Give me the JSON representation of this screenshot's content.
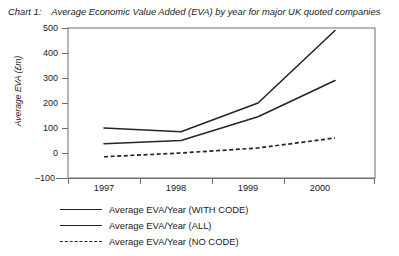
{
  "title": {
    "label": "Chart 1:",
    "text": "Average Economic Value Added (EVA) by year for major UK quoted companies"
  },
  "chart_data": {
    "type": "line",
    "title": "Average Economic Value Added (EVA) by year for major UK quoted companies",
    "xlabel": "",
    "ylabel": "Average EVA (£m)",
    "categories": [
      "1997",
      "1998",
      "1999",
      "2000"
    ],
    "x": [
      1997,
      1998,
      1999,
      2000
    ],
    "ylim": [
      -100,
      500
    ],
    "yticks": [
      -100,
      0,
      100,
      200,
      300,
      400,
      500
    ],
    "ytick_labels": [
      "–100",
      "0",
      "100",
      "200",
      "300",
      "400",
      "500"
    ],
    "xtick_labels": [
      "1997",
      "1998",
      "1999",
      "2000"
    ],
    "grid": false,
    "legend_position": "below",
    "series": [
      {
        "name": "Average EVA/Year (WITH CODE)",
        "style": "solid",
        "color": "#262626",
        "values": [
          100,
          85,
          200,
          490
        ]
      },
      {
        "name": "Average EVA/Year (ALL)",
        "style": "solid",
        "color": "#262626",
        "values": [
          37,
          50,
          145,
          290
        ]
      },
      {
        "name": "Average EVA/Year (NO CODE)",
        "style": "dashed",
        "color": "#262626",
        "values": [
          -15,
          0,
          20,
          60
        ]
      }
    ]
  },
  "axis": {
    "y_title": "Average EVA (£m)",
    "y_ticks": [
      "500",
      "400",
      "300",
      "200",
      "100",
      "0",
      "–100"
    ],
    "x_ticks": [
      "1997",
      "1998",
      "1999",
      "2000"
    ]
  },
  "legend": {
    "items": [
      {
        "label": "Average EVA/Year (WITH CODE)",
        "style": "solid"
      },
      {
        "label": "Average EVA/Year (ALL)",
        "style": "solid"
      },
      {
        "label": "Average EVA/Year (NO CODE)",
        "style": "dashed"
      }
    ]
  }
}
